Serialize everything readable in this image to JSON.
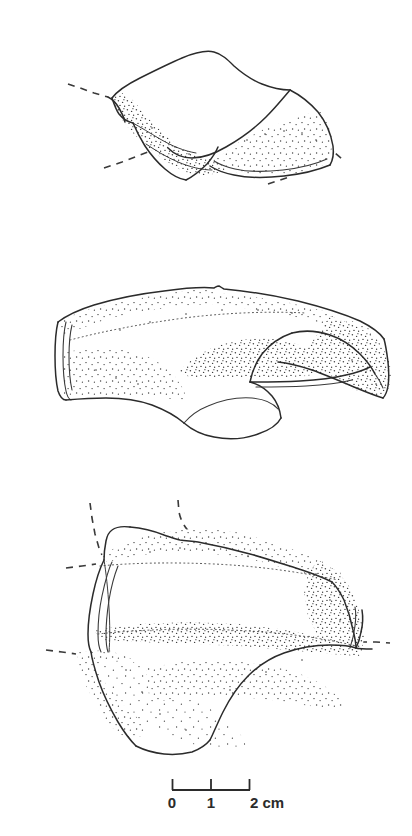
{
  "figure": {
    "kind": "archaeological-line-drawing",
    "background_color": "#ffffff",
    "ink_color": "#2b2b2b",
    "stipple_color": "#3f3f3f",
    "views": [
      {
        "id": "view-top",
        "name": "oblique-view",
        "position": "top",
        "has_stippled_shading": true,
        "has_reconstruction_lines": true,
        "reconstruction_line_count": 4
      },
      {
        "id": "view-middle",
        "name": "profile-view",
        "position": "middle",
        "has_stippled_shading": true,
        "has_reconstruction_lines": false,
        "reconstruction_line_count": 0
      },
      {
        "id": "view-bottom",
        "name": "section-view",
        "position": "bottom",
        "has_stippled_shading": true,
        "has_reconstruction_lines": true,
        "reconstruction_line_count": 4
      }
    ]
  },
  "scale_bar": {
    "name": "scale-bar",
    "unit": "cm",
    "total_length_cm": 2,
    "tick_values": [
      "0",
      "1",
      "2 cm"
    ],
    "tick_positions_px": [
      172,
      211,
      250
    ],
    "bar_y_px": 790,
    "label_y_px": 806,
    "labels": {
      "zero": "0",
      "one": "1",
      "two": "2 cm"
    }
  }
}
